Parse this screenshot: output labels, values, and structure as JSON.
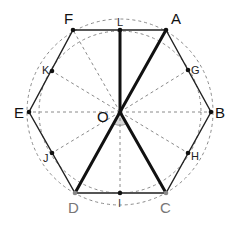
{
  "diagram": {
    "type": "regular-hexagon-geometry",
    "center": {
      "label": "O",
      "x": 120,
      "y": 112
    },
    "vertices": [
      {
        "label": "A",
        "x": 166,
        "y": 30
      },
      {
        "label": "B",
        "x": 211,
        "y": 112
      },
      {
        "label": "C",
        "x": 166,
        "y": 193
      },
      {
        "label": "D",
        "x": 75,
        "y": 193
      },
      {
        "label": "E",
        "x": 29,
        "y": 112
      },
      {
        "label": "F",
        "x": 73,
        "y": 30
      }
    ],
    "midpoints": [
      {
        "label": "G",
        "x": 188,
        "y": 70,
        "edge": "AB"
      },
      {
        "label": "H",
        "x": 188,
        "y": 153,
        "edge": "BC"
      },
      {
        "label": "I",
        "x": 120,
        "y": 193,
        "edge": "CD"
      },
      {
        "label": "J",
        "x": 52,
        "y": 153,
        "edge": "DE"
      },
      {
        "label": "K",
        "x": 52,
        "y": 71,
        "edge": "EF"
      },
      {
        "label": "L",
        "x": 120,
        "y": 30,
        "edge": "FA"
      }
    ],
    "bold_segments": [
      "OL",
      "OA",
      "OD",
      "OC"
    ],
    "angle_marker": {
      "at": "O",
      "between": [
        "OD",
        "OC"
      ]
    },
    "circumscribed_circle": {
      "cx": 120,
      "cy": 112,
      "r": 93,
      "style": "dashed"
    },
    "inscribed_circle": {
      "cx": 120,
      "cy": 112,
      "r": 80,
      "style": "dashed"
    },
    "colors": {
      "line": "#111111",
      "dashed": "#888888",
      "gray_label": "#666666",
      "angle_fill": "#d8d8d8"
    }
  },
  "labels": {
    "A": "A",
    "B": "B",
    "C": "C",
    "D": "D",
    "E": "E",
    "F": "F",
    "G": "G",
    "H": "H",
    "I": "I",
    "J": "J",
    "K": "K",
    "L": "L",
    "O": "O"
  }
}
